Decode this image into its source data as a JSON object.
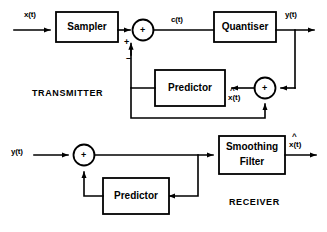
{
  "figure": {
    "line_color": "#000000",
    "background": "#ffffff"
  },
  "sections": {
    "transmitter_label": "TRANSMITTER",
    "receiver_label": "RECEIVER"
  },
  "transmitter": {
    "input_signal": "x(t)",
    "blocks": {
      "sampler": "Sampler",
      "quantiser": "Quantiser",
      "predictor": "Predictor"
    },
    "signals": {
      "error": "c(t)",
      "output": "y(t)",
      "prediction": "x(t)",
      "prediction_hat": "^"
    },
    "summer_1": {
      "inside": "+",
      "input_sign_left": "+",
      "input_sign_bottom": "–"
    },
    "summer_2": {
      "inside": "+"
    }
  },
  "receiver": {
    "input_signal": "y(t)",
    "blocks": {
      "predictor": "Predictor",
      "smoothing_filter_line1": "Smoothing",
      "smoothing_filter_line2": "Filter"
    },
    "signals": {
      "output": "x(t)",
      "output_hat": "^"
    },
    "summer": {
      "inside": "+"
    }
  }
}
